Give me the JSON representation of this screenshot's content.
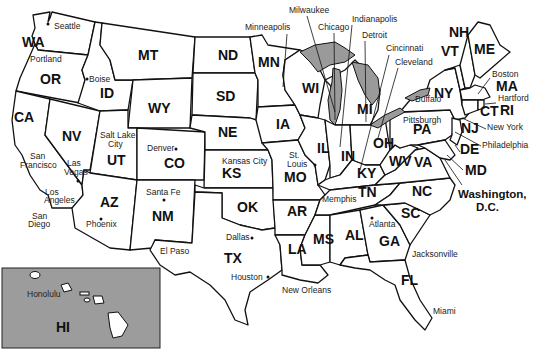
{
  "map": {
    "title": "United States",
    "states": [
      {
        "abbr": "WA",
        "x": 22,
        "y": 47
      },
      {
        "abbr": "OR",
        "x": 40,
        "y": 84
      },
      {
        "abbr": "CA",
        "x": 14,
        "y": 122
      },
      {
        "abbr": "NV",
        "x": 62,
        "y": 141
      },
      {
        "abbr": "ID",
        "x": 100,
        "y": 98
      },
      {
        "abbr": "MT",
        "x": 138,
        "y": 60
      },
      {
        "abbr": "WY",
        "x": 148,
        "y": 113
      },
      {
        "abbr": "UT",
        "x": 107,
        "y": 165
      },
      {
        "abbr": "AZ",
        "x": 100,
        "y": 207
      },
      {
        "abbr": "CO",
        "x": 164,
        "y": 168
      },
      {
        "abbr": "NM",
        "x": 152,
        "y": 221
      },
      {
        "abbr": "ND",
        "x": 218,
        "y": 60
      },
      {
        "abbr": "SD",
        "x": 216,
        "y": 101
      },
      {
        "abbr": "NE",
        "x": 218,
        "y": 137
      },
      {
        "abbr": "KS",
        "x": 222,
        "y": 178
      },
      {
        "abbr": "OK",
        "x": 237,
        "y": 212
      },
      {
        "abbr": "TX",
        "x": 224,
        "y": 263
      },
      {
        "abbr": "MN",
        "x": 258,
        "y": 67
      },
      {
        "abbr": "IA",
        "x": 276,
        "y": 129
      },
      {
        "abbr": "MO",
        "x": 284,
        "y": 182
      },
      {
        "abbr": "AR",
        "x": 287,
        "y": 216
      },
      {
        "abbr": "LA",
        "x": 288,
        "y": 254
      },
      {
        "abbr": "WI",
        "x": 302,
        "y": 93
      },
      {
        "abbr": "IL",
        "x": 317,
        "y": 153
      },
      {
        "abbr": "MS",
        "x": 313,
        "y": 244
      },
      {
        "abbr": "MI",
        "x": 357,
        "y": 114
      },
      {
        "abbr": "IN",
        "x": 341,
        "y": 161
      },
      {
        "abbr": "AL",
        "x": 345,
        "y": 240
      },
      {
        "abbr": "OH",
        "x": 373,
        "y": 148
      },
      {
        "abbr": "KY",
        "x": 357,
        "y": 178
      },
      {
        "abbr": "TN",
        "x": 358,
        "y": 197
      },
      {
        "abbr": "GA",
        "x": 379,
        "y": 246
      },
      {
        "abbr": "FL",
        "x": 401,
        "y": 285
      },
      {
        "abbr": "SC",
        "x": 401,
        "y": 218
      },
      {
        "abbr": "NC",
        "x": 412,
        "y": 196
      },
      {
        "abbr": "VA",
        "x": 414,
        "y": 167
      },
      {
        "abbr": "WV",
        "x": 389,
        "y": 166
      },
      {
        "abbr": "PA",
        "x": 413,
        "y": 134
      },
      {
        "abbr": "NY",
        "x": 434,
        "y": 98
      },
      {
        "abbr": "VT",
        "x": 441,
        "y": 56
      },
      {
        "abbr": "NH",
        "x": 449,
        "y": 37
      },
      {
        "abbr": "ME",
        "x": 474,
        "y": 54
      },
      {
        "abbr": "MA",
        "x": 496,
        "y": 91
      },
      {
        "abbr": "CT",
        "x": 480,
        "y": 116
      },
      {
        "abbr": "RI",
        "x": 500,
        "y": 115
      },
      {
        "abbr": "NJ",
        "x": 461,
        "y": 133
      },
      {
        "abbr": "DE",
        "x": 460,
        "y": 154
      },
      {
        "abbr": "MD",
        "x": 465,
        "y": 175
      },
      {
        "abbr": "HI",
        "x": 56,
        "y": 332
      }
    ],
    "cities": [
      {
        "name": "Seattle",
        "x": 54,
        "y": 29,
        "dot": [
          48,
          24
        ]
      },
      {
        "name": "Portland",
        "x": 30,
        "y": 62
      },
      {
        "name": "Boise",
        "x": 89,
        "y": 82,
        "dot": [
          87,
          79
        ]
      },
      {
        "name": "Salt Lake",
        "x": 100,
        "y": 138
      },
      {
        "name": "City",
        "x": 108,
        "y": 147
      },
      {
        "name": "San",
        "x": 30,
        "y": 159
      },
      {
        "name": "Francisco",
        "x": 20,
        "y": 168
      },
      {
        "name": "Las",
        "x": 67,
        "y": 166
      },
      {
        "name": "Vegas",
        "x": 64,
        "y": 175
      },
      {
        "name": "Los",
        "x": 45,
        "y": 195
      },
      {
        "name": "Angeles",
        "x": 44,
        "y": 203
      },
      {
        "name": "San",
        "x": 32,
        "y": 219
      },
      {
        "name": "Diego",
        "x": 28,
        "y": 227
      },
      {
        "name": "Phoenix",
        "x": 86,
        "y": 227,
        "dot": [
          101,
          219
        ]
      },
      {
        "name": "Denver",
        "x": 147,
        "y": 151,
        "dot": [
          176,
          149
        ]
      },
      {
        "name": "Santa Fe",
        "x": 146,
        "y": 195,
        "dot": [
          164,
          200
        ]
      },
      {
        "name": "El Paso",
        "x": 160,
        "y": 254
      },
      {
        "name": "Minneapolis",
        "x": 245,
        "y": 30,
        "dot": [
          283,
          88
        ]
      },
      {
        "name": "Milwaukee",
        "x": 289,
        "y": 13
      },
      {
        "name": "Chicago",
        "x": 318,
        "y": 30
      },
      {
        "name": "Indianapolis",
        "x": 352,
        "y": 22
      },
      {
        "name": "Detroit",
        "x": 362,
        "y": 38
      },
      {
        "name": "Cincinnati",
        "x": 386,
        "y": 51
      },
      {
        "name": "Cleveland",
        "x": 395,
        "y": 65
      },
      {
        "name": "Boston",
        "x": 492,
        "y": 77
      },
      {
        "name": "Hartford",
        "x": 498,
        "y": 101
      },
      {
        "name": "Buffalo",
        "x": 415,
        "y": 102
      },
      {
        "name": "Pittsburgh",
        "x": 403,
        "y": 123
      },
      {
        "name": "New York",
        "x": 487,
        "y": 130
      },
      {
        "name": "Philadelphia",
        "x": 482,
        "y": 148
      },
      {
        "name": "Kansas City",
        "x": 222,
        "y": 164
      },
      {
        "name": "St.",
        "x": 289,
        "y": 158
      },
      {
        "name": "Louis",
        "x": 287,
        "y": 167,
        "dot": [
          315,
          165
        ]
      },
      {
        "name": "Memphis",
        "x": 322,
        "y": 202
      },
      {
        "name": "Dallas",
        "x": 226,
        "y": 240,
        "dot": [
          252,
          238
        ]
      },
      {
        "name": "Houston",
        "x": 231,
        "y": 280,
        "dot": [
          268,
          277
        ]
      },
      {
        "name": "New Orleans",
        "x": 282,
        "y": 293
      },
      {
        "name": "Atlanta",
        "x": 369,
        "y": 227,
        "dot": [
          372,
          218
        ]
      },
      {
        "name": "Jacksonville",
        "x": 412,
        "y": 257
      },
      {
        "name": "Miami",
        "x": 433,
        "y": 314
      },
      {
        "name": "Honolulu",
        "x": 27,
        "y": 297
      }
    ],
    "capital": {
      "line1": "Washington,",
      "line2": "D.C."
    }
  }
}
